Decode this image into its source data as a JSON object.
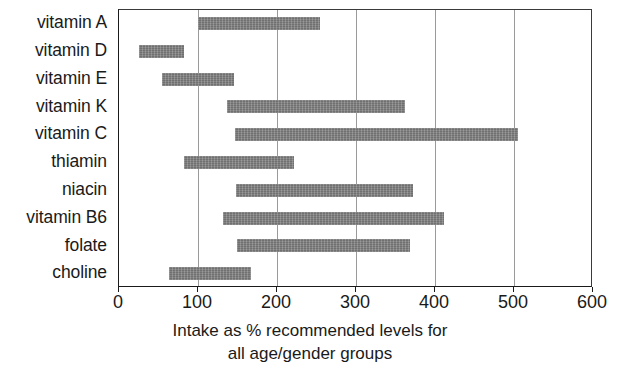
{
  "chart_data": {
    "type": "bar",
    "bar_orientation": "horizontal",
    "bar_style": "range",
    "title": "",
    "subtitle": "",
    "xlabel_line1": "Intake as % recommended levels for",
    "xlabel_line2": "all age/gender groups",
    "ylabel": "",
    "xlim": [
      0,
      600
    ],
    "ylim": null,
    "grid": "vertical",
    "legend": "none",
    "bar_color": "#7d7d7d",
    "axis_color": "#1a1a1a",
    "gridline_color": "#9a9a9a",
    "xticks": [
      0,
      100,
      200,
      300,
      400,
      500,
      600
    ],
    "xticklabels": [
      "0",
      "100",
      "200",
      "300",
      "400",
      "500",
      "600"
    ],
    "categories": [
      "vitamin A",
      "vitamin D",
      "vitamin E",
      "vitamin K",
      "vitamin C",
      "thiamin",
      "niacin",
      "vitamin B6",
      "folate",
      "choline"
    ],
    "ranges": [
      {
        "category": "vitamin A",
        "low": 100,
        "high": 255
      },
      {
        "category": "vitamin D",
        "low": 25,
        "high": 82
      },
      {
        "category": "vitamin E",
        "low": 55,
        "high": 145
      },
      {
        "category": "vitamin K",
        "low": 137,
        "high": 362
      },
      {
        "category": "vitamin C",
        "low": 147,
        "high": 505
      },
      {
        "category": "thiamin",
        "low": 82,
        "high": 222
      },
      {
        "category": "niacin",
        "low": 148,
        "high": 372
      },
      {
        "category": "vitamin B6",
        "low": 132,
        "high": 412
      },
      {
        "category": "folate",
        "low": 149,
        "high": 368
      },
      {
        "category": "choline",
        "low": 63,
        "high": 167
      }
    ],
    "lows": [
      100,
      25,
      55,
      137,
      147,
      82,
      148,
      132,
      149,
      63
    ],
    "highs": [
      255,
      82,
      145,
      362,
      505,
      222,
      372,
      412,
      368,
      167
    ]
  }
}
